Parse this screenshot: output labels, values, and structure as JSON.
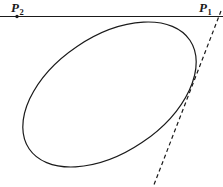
{
  "figure": {
    "background_color": "#ffffff",
    "stroke_color": "#1a1a1a",
    "width": 223,
    "height": 187
  },
  "labels": {
    "p2": {
      "base": "P",
      "subscript": "2"
    },
    "p1": {
      "base": "P",
      "subscript": "1"
    }
  },
  "geometry": {
    "horizontal_line": {
      "name": "line through P2 and P1",
      "x1": 0,
      "y1": 16.5,
      "x2": 223,
      "y2": 16.5,
      "stroke_width": 1.1,
      "style": "solid"
    },
    "dashed_line": {
      "name": "tangent line through P1",
      "x1": 221,
      "y1": 11,
      "x2": 153.5,
      "y2": 186,
      "stroke_width": 1.2,
      "style": "dashed",
      "dash_pattern": "4,3"
    },
    "ellipse": {
      "center_x": 109.5,
      "center_y": 94.5,
      "radius_x": 97,
      "radius_y": 58,
      "rotation_deg": -34,
      "stroke_width": 1.2,
      "fill": "none"
    },
    "points": [
      {
        "name": "P2",
        "x": 17,
        "y": 16.5,
        "marker": "dot",
        "radius": 1.7
      },
      {
        "name": "P1",
        "x": 218.5,
        "y": 16.5,
        "marker": "none",
        "radius": 0
      }
    ]
  }
}
